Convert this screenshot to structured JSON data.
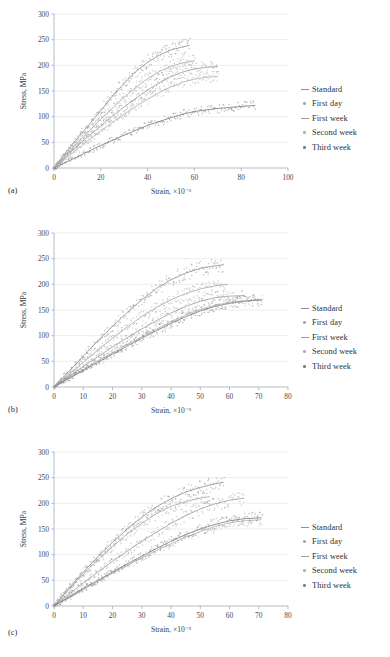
{
  "figure": {
    "series_names": [
      "Standard",
      "First day",
      "First week",
      "Second week",
      "Third week"
    ],
    "series_colors": [
      "#8f8f8f",
      "#a8a8a8",
      "#9c9c9c",
      "#b0b0b0",
      "#7d7d7d"
    ],
    "ylabel": "Stress, MPa",
    "xlabel": "Strain, ×10⁻³"
  },
  "panels": [
    {
      "tag": "(a)"
    },
    {
      "tag": "(b)"
    },
    {
      "tag": "(c)"
    }
  ],
  "legend": {
    "items": [
      {
        "label": "Standard",
        "marker": "line",
        "color": "#8f8f8f"
      },
      {
        "label": "First day",
        "marker": "dot",
        "color": "#a8a8a8"
      },
      {
        "label": "First week",
        "marker": "line",
        "color": "#9c9c9c"
      },
      {
        "label": "Second week",
        "marker": "dot",
        "color": "#b0b0b0"
      },
      {
        "label": "Third week",
        "marker": "dot",
        "color": "#7d7d7d"
      }
    ]
  },
  "chart_data": [
    {
      "type": "scatter",
      "title": "(a)",
      "xlabel": "Strain, ×10⁻³",
      "ylabel": "Stress, MPa",
      "xlim": [
        0,
        100
      ],
      "ylim": [
        0,
        300
      ],
      "xticks": [
        0,
        20,
        40,
        60,
        80,
        100
      ],
      "yticks": [
        0,
        50,
        100,
        150,
        200,
        250,
        300
      ],
      "grid": true,
      "legend_position": "right",
      "series": [
        {
          "name": "Standard",
          "color": "#8f8f8f",
          "x_end": 58,
          "y_end": 238,
          "curve": [
            [
              0,
              0
            ],
            [
              5,
              30
            ],
            [
              10,
              58
            ],
            [
              15,
              85
            ],
            [
              20,
              112
            ],
            [
              25,
              140
            ],
            [
              30,
              165
            ],
            [
              35,
              188
            ],
            [
              40,
              206
            ],
            [
              45,
              220
            ],
            [
              50,
              230
            ],
            [
              55,
              236
            ],
            [
              58,
              239
            ]
          ]
        },
        {
          "name": "First day",
          "color": "#a8a8a8",
          "x_end": 60,
          "y_end": 208,
          "curve": [
            [
              0,
              0
            ],
            [
              5,
              25
            ],
            [
              10,
              49
            ],
            [
              15,
              72
            ],
            [
              20,
              95
            ],
            [
              25,
              117
            ],
            [
              30,
              138
            ],
            [
              35,
              157
            ],
            [
              40,
              174
            ],
            [
              45,
              188
            ],
            [
              50,
              198
            ],
            [
              55,
              205
            ],
            [
              60,
              209
            ]
          ]
        },
        {
          "name": "First week",
          "color": "#9c9c9c",
          "x_end": 70,
          "y_end": 198,
          "curve": [
            [
              0,
              0
            ],
            [
              5,
              22
            ],
            [
              10,
              43
            ],
            [
              15,
              63
            ],
            [
              20,
              82
            ],
            [
              25,
              101
            ],
            [
              30,
              119
            ],
            [
              35,
              136
            ],
            [
              40,
              152
            ],
            [
              45,
              166
            ],
            [
              50,
              178
            ],
            [
              55,
              187
            ],
            [
              60,
              193
            ],
            [
              65,
              196
            ],
            [
              70,
              198
            ]
          ]
        },
        {
          "name": "Second week",
          "color": "#b0b0b0",
          "x_end": 70,
          "y_end": 178,
          "curve": [
            [
              0,
              0
            ],
            [
              5,
              19
            ],
            [
              10,
              37
            ],
            [
              15,
              55
            ],
            [
              20,
              72
            ],
            [
              25,
              89
            ],
            [
              30,
              105
            ],
            [
              35,
              120
            ],
            [
              40,
              134
            ],
            [
              45,
              147
            ],
            [
              50,
              158
            ],
            [
              55,
              167
            ],
            [
              60,
              173
            ],
            [
              65,
              177
            ],
            [
              70,
              178
            ]
          ]
        },
        {
          "name": "Third week",
          "color": "#7d7d7d",
          "x_end": 86,
          "y_end": 122,
          "curve": [
            [
              0,
              0
            ],
            [
              10,
              22
            ],
            [
              20,
              44
            ],
            [
              30,
              64
            ],
            [
              40,
              83
            ],
            [
              50,
              98
            ],
            [
              55,
              105
            ],
            [
              60,
              110
            ],
            [
              65,
              113
            ],
            [
              70,
              116
            ],
            [
              75,
              118
            ],
            [
              80,
              120
            ],
            [
              86,
              122
            ]
          ]
        }
      ]
    },
    {
      "type": "scatter",
      "title": "(b)",
      "xlabel": "Strain, ×10⁻³",
      "ylabel": "Stress, MPa",
      "xlim": [
        0,
        80
      ],
      "ylim": [
        0,
        300
      ],
      "xticks": [
        0,
        10,
        20,
        30,
        40,
        50,
        60,
        70,
        80
      ],
      "yticks": [
        0,
        50,
        100,
        150,
        200,
        250,
        300
      ],
      "grid": true,
      "legend_position": "right",
      "series": [
        {
          "name": "Standard",
          "color": "#8f8f8f",
          "x_end": 58,
          "y_end": 238,
          "curve": [
            [
              0,
              0
            ],
            [
              5,
              30
            ],
            [
              10,
              60
            ],
            [
              15,
              90
            ],
            [
              20,
              118
            ],
            [
              25,
              145
            ],
            [
              30,
              170
            ],
            [
              35,
              192
            ],
            [
              40,
              209
            ],
            [
              45,
              222
            ],
            [
              50,
              231
            ],
            [
              55,
              236
            ],
            [
              58,
              238
            ]
          ]
        },
        {
          "name": "First day",
          "color": "#a8a8a8",
          "x_end": 59,
          "y_end": 199,
          "curve": [
            [
              0,
              0
            ],
            [
              5,
              24
            ],
            [
              10,
              48
            ],
            [
              15,
              72
            ],
            [
              20,
              95
            ],
            [
              25,
              117
            ],
            [
              30,
              137
            ],
            [
              35,
              155
            ],
            [
              40,
              170
            ],
            [
              45,
              182
            ],
            [
              50,
              191
            ],
            [
              55,
              197
            ],
            [
              59,
              200
            ]
          ]
        },
        {
          "name": "First week",
          "color": "#9c9c9c",
          "x_end": 65,
          "y_end": 178,
          "curve": [
            [
              0,
              0
            ],
            [
              5,
              20
            ],
            [
              10,
              40
            ],
            [
              15,
              59
            ],
            [
              20,
              78
            ],
            [
              25,
              96
            ],
            [
              30,
              113
            ],
            [
              35,
              129
            ],
            [
              40,
              144
            ],
            [
              45,
              157
            ],
            [
              50,
              167
            ],
            [
              55,
              174
            ],
            [
              60,
              177
            ],
            [
              65,
              178
            ]
          ]
        },
        {
          "name": "Second week",
          "color": "#b0b0b0",
          "x_end": 71,
          "y_end": 170,
          "curve": [
            [
              0,
              0
            ],
            [
              5,
              17
            ],
            [
              10,
              34
            ],
            [
              15,
              51
            ],
            [
              20,
              67
            ],
            [
              25,
              83
            ],
            [
              30,
              98
            ],
            [
              35,
              113
            ],
            [
              40,
              127
            ],
            [
              45,
              140
            ],
            [
              50,
              151
            ],
            [
              55,
              159
            ],
            [
              60,
              165
            ],
            [
              65,
              168
            ],
            [
              71,
              170
            ]
          ]
        },
        {
          "name": "Third week",
          "color": "#7d7d7d",
          "x_end": 71,
          "y_end": 170,
          "curve": [
            [
              0,
              0
            ],
            [
              5,
              16
            ],
            [
              10,
              32
            ],
            [
              15,
              48
            ],
            [
              20,
              64
            ],
            [
              25,
              80
            ],
            [
              30,
              95
            ],
            [
              35,
              110
            ],
            [
              40,
              124
            ],
            [
              45,
              137
            ],
            [
              50,
              148
            ],
            [
              55,
              157
            ],
            [
              60,
              163
            ],
            [
              65,
              167
            ],
            [
              71,
              170
            ]
          ]
        }
      ]
    },
    {
      "type": "scatter",
      "title": "(c)",
      "xlabel": "Strain, ×10⁻³",
      "ylabel": "Stress, MPa",
      "xlim": [
        0,
        80
      ],
      "ylim": [
        0,
        300
      ],
      "xticks": [
        0,
        10,
        20,
        30,
        40,
        50,
        60,
        70,
        80
      ],
      "yticks": [
        0,
        50,
        100,
        150,
        200,
        250,
        300
      ],
      "grid": true,
      "legend_position": "right",
      "series": [
        {
          "name": "Standard",
          "color": "#8f8f8f",
          "x_end": 58,
          "y_end": 240,
          "curve": [
            [
              0,
              0
            ],
            [
              5,
              34
            ],
            [
              10,
              66
            ],
            [
              15,
              96
            ],
            [
              20,
              124
            ],
            [
              25,
              150
            ],
            [
              30,
              173
            ],
            [
              35,
              193
            ],
            [
              40,
              209
            ],
            [
              45,
              222
            ],
            [
              50,
              231
            ],
            [
              55,
              238
            ],
            [
              58,
              241
            ]
          ]
        },
        {
          "name": "First day",
          "color": "#a8a8a8",
          "x_end": 53,
          "y_end": 212,
          "curve": [
            [
              0,
              0
            ],
            [
              5,
              32
            ],
            [
              10,
              62
            ],
            [
              15,
              90
            ],
            [
              20,
              116
            ],
            [
              25,
              140
            ],
            [
              30,
              161
            ],
            [
              35,
              180
            ],
            [
              40,
              194
            ],
            [
              45,
              204
            ],
            [
              50,
              210
            ],
            [
              53,
              213
            ]
          ]
        },
        {
          "name": "First week",
          "color": "#9c9c9c",
          "x_end": 65,
          "y_end": 210,
          "curve": [
            [
              0,
              0
            ],
            [
              5,
              23
            ],
            [
              10,
              45
            ],
            [
              15,
              66
            ],
            [
              20,
              87
            ],
            [
              25,
              107
            ],
            [
              30,
              126
            ],
            [
              35,
              144
            ],
            [
              40,
              161
            ],
            [
              45,
              176
            ],
            [
              50,
              189
            ],
            [
              55,
              199
            ],
            [
              60,
              206
            ],
            [
              65,
              210
            ]
          ]
        },
        {
          "name": "Second week",
          "color": "#b0b0b0",
          "x_end": 71,
          "y_end": 168,
          "curve": [
            [
              0,
              0
            ],
            [
              5,
              16
            ],
            [
              10,
              32
            ],
            [
              15,
              48
            ],
            [
              20,
              64
            ],
            [
              25,
              79
            ],
            [
              30,
              94
            ],
            [
              35,
              108
            ],
            [
              40,
              121
            ],
            [
              45,
              134
            ],
            [
              50,
              145
            ],
            [
              55,
              155
            ],
            [
              60,
              162
            ],
            [
              65,
              166
            ],
            [
              71,
              168
            ]
          ]
        },
        {
          "name": "Third week",
          "color": "#7d7d7d",
          "x_end": 71,
          "y_end": 172,
          "curve": [
            [
              0,
              0
            ],
            [
              5,
              17
            ],
            [
              10,
              34
            ],
            [
              15,
              50
            ],
            [
              20,
              66
            ],
            [
              25,
              82
            ],
            [
              30,
              97
            ],
            [
              35,
              112
            ],
            [
              40,
              126
            ],
            [
              45,
              139
            ],
            [
              50,
              150
            ],
            [
              55,
              159
            ],
            [
              60,
              166
            ],
            [
              65,
              170
            ],
            [
              71,
              172
            ]
          ]
        }
      ]
    }
  ]
}
